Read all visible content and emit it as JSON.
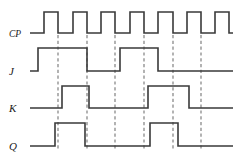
{
  "figure": {
    "type": "digital-timing-waveform",
    "colors": {
      "background": "#ffffff",
      "signal": "#3a3a3a",
      "reference_line": "#8a8a8a",
      "label": "#1a1a1a"
    }
  },
  "axis": {
    "x_start": 30,
    "x_end": 230,
    "unit_width": 14.3,
    "clock_pulse_count": 7
  },
  "labels": {
    "cp": "CP",
    "j": "J",
    "k": "K",
    "q": "Q"
  },
  "reference_lines": {
    "count": 6,
    "x_positions": [
      58,
      87,
      115,
      144,
      173,
      201
    ],
    "description": "dashed vertical lines at clock falling edges"
  },
  "chart_data": {
    "type": "line",
    "xlabel": "",
    "ylabel": "",
    "grid": false,
    "legend": "none",
    "x_unit": "clock half-period",
    "levels": [
      0,
      1
    ],
    "series": [
      {
        "name": "CP",
        "label": "CP",
        "row_top": 12,
        "row_bottom": 33,
        "transitions": [
          {
            "x": 30,
            "level": 0
          },
          {
            "x": 44,
            "level": 1
          },
          {
            "x": 58,
            "level": 0
          },
          {
            "x": 73,
            "level": 1
          },
          {
            "x": 87,
            "level": 0
          },
          {
            "x": 101,
            "level": 1
          },
          {
            "x": 115,
            "level": 0
          },
          {
            "x": 130,
            "level": 1
          },
          {
            "x": 144,
            "level": 0
          },
          {
            "x": 158,
            "level": 1
          },
          {
            "x": 173,
            "level": 0
          },
          {
            "x": 187,
            "level": 1
          },
          {
            "x": 201,
            "level": 0
          },
          {
            "x": 215,
            "level": 1
          },
          {
            "x": 229,
            "level": 0
          },
          {
            "x": 233,
            "level": 0
          }
        ]
      },
      {
        "name": "J",
        "label": "J",
        "row_top": 48,
        "row_bottom": 71,
        "transitions": [
          {
            "x": 30,
            "level": 0
          },
          {
            "x": 38,
            "level": 1
          },
          {
            "x": 87,
            "level": 0
          },
          {
            "x": 120,
            "level": 1
          },
          {
            "x": 158,
            "level": 0
          },
          {
            "x": 233,
            "level": 0
          }
        ]
      },
      {
        "name": "K",
        "label": "K",
        "row_top": 86,
        "row_bottom": 108,
        "transitions": [
          {
            "x": 30,
            "level": 0
          },
          {
            "x": 62,
            "level": 1
          },
          {
            "x": 89,
            "level": 0
          },
          {
            "x": 148,
            "level": 1
          },
          {
            "x": 189,
            "level": 0
          },
          {
            "x": 233,
            "level": 0
          }
        ]
      },
      {
        "name": "Q",
        "label": "Q",
        "row_top": 123,
        "row_bottom": 146,
        "transitions": [
          {
            "x": 30,
            "level": 0
          },
          {
            "x": 55,
            "level": 1
          },
          {
            "x": 85,
            "level": 0
          },
          {
            "x": 150,
            "level": 1
          },
          {
            "x": 178,
            "level": 0
          },
          {
            "x": 233,
            "level": 0
          }
        ]
      }
    ]
  }
}
